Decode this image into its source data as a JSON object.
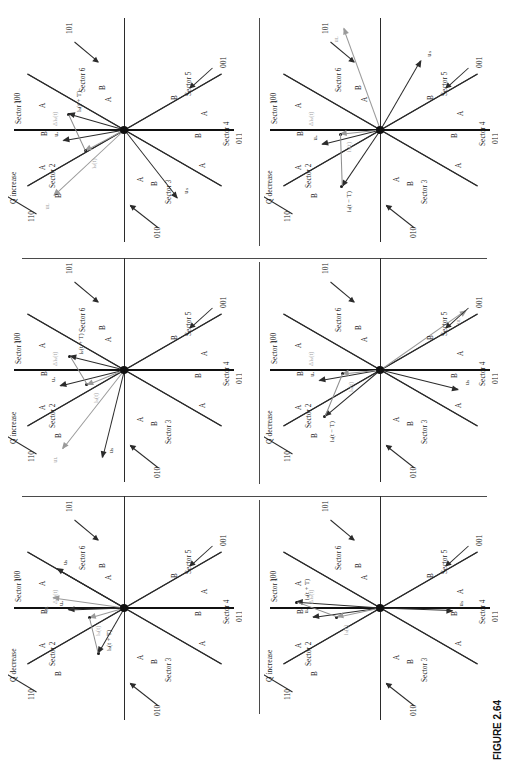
{
  "figure": {
    "caption": "FIGURE 2.64"
  },
  "common": {
    "sectors": [
      {
        "name": "Sector 1",
        "code": "100"
      },
      {
        "name": "Sector 2",
        "code": "110"
      },
      {
        "name": "Sector 3",
        "code": "010"
      },
      {
        "name": "Sector 4",
        "code": "011"
      },
      {
        "name": "Sector 5",
        "code": "001"
      },
      {
        "name": "Sector 6",
        "code": "101"
      }
    ],
    "region_labels": {
      "a": "A",
      "b": "B"
    },
    "vectors": {
      "us": "uₛ",
      "ua": "uₐ",
      "uL": "uʟ",
      "is_t": "iₛ(t)",
      "is_t_plus_T": "iₛ(t + T)",
      "is_t_minus_T": "iₛ(t − T)",
      "delta_is": "Δiₛ(t)"
    },
    "colors": {
      "line": "#2b2b2b",
      "axis": "#111111",
      "dashed_axis": "#b0b0b0",
      "gray_vector": "#9a9a9a",
      "divider": "#4a4a4a",
      "background": "#ffffff"
    }
  },
  "panels": [
    {
      "id": "top-left",
      "row": 1,
      "col": 1,
      "title_line1": "P increase",
      "title_line2": "Q increase",
      "shown_vectors": [
        "uₛ",
        "uₐ",
        "uʟ",
        "iₛ(t)",
        "iₛ(t + T)",
        "Δiₛ(t)"
      ]
    },
    {
      "id": "top-right",
      "row": 1,
      "col": 2,
      "title_line1": "P increase",
      "title_line2": "Q decrease",
      "shown_vectors": [
        "uₛ",
        "uₐ",
        "uʟ",
        "iₛ(t)",
        "iₛ(t − T)",
        "Δiₛ(t)"
      ]
    },
    {
      "id": "middle-left",
      "row": 2,
      "col": 1,
      "title_line1": "P increase",
      "title_line2": "Q increase",
      "shown_vectors": [
        "uₛ",
        "uₐ",
        "uʟ",
        "iₛ(t)",
        "iₛ(t + T)",
        "Δiₛ(t)"
      ]
    },
    {
      "id": "middle-right",
      "row": 2,
      "col": 2,
      "title_line1": "P increase",
      "title_line2": "Q decrease",
      "shown_vectors": [
        "uₛ",
        "uₐ",
        "uʟ",
        "iₛ(t)",
        "iₛ(t − T)",
        "Δiₛ(t)"
      ]
    },
    {
      "id": "bottom-left",
      "row": 3,
      "col": 1,
      "title_line1": "P decrease",
      "title_line2": "Q decrease",
      "shown_vectors": [
        "uₛ",
        "uₐ",
        "uʟ",
        "iₛ(t)",
        "iₛ(t + T)",
        "Δiₛ(t)"
      ]
    },
    {
      "id": "bottom-right",
      "row": 3,
      "col": 2,
      "title_line1": "P increase",
      "title_line2": "Q increase",
      "shown_vectors": [
        "uₛ",
        "uₐ",
        "iₛ(t)",
        "iₛ(t + T)",
        "Δiₛ(t)"
      ]
    }
  ]
}
